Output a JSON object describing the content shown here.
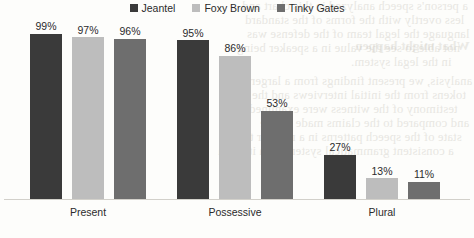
{
  "chart_data": {
    "type": "bar",
    "title": "",
    "subtitle": "",
    "xlabel": "",
    "ylabel": "",
    "ylim": [
      0,
      100
    ],
    "grid": false,
    "legend_position": "top-center",
    "value_suffix": "%",
    "categories": [
      "Present",
      "Possessive",
      "Plural"
    ],
    "series": [
      {
        "name": "Jeantel",
        "color": "#3a3a3a",
        "values": [
          99,
          97,
          96
        ],
        "labels": [
          "99%",
          "97%",
          "96%"
        ]
      },
      {
        "name": "Foxy Brown",
        "color": "#bdbdbd",
        "values": [
          95,
          86,
          53
        ],
        "labels": [
          "95%",
          "86%",
          "53%"
        ]
      },
      {
        "name": "Tinky Gates",
        "color": "#6e6e6e",
        "values": [
          27,
          13,
          11
        ],
        "labels": [
          "27%",
          "13%",
          "11%"
        ]
      }
    ],
    "groups": [
      {
        "category": "Present",
        "bars": [
          {
            "series": "Jeantel",
            "value": 99,
            "label": "99%",
            "color": "#3a3a3a"
          },
          {
            "series": "Foxy Brown",
            "value": 97,
            "label": "97%",
            "color": "#bdbdbd"
          },
          {
            "series": "Tinky Gates",
            "value": 96,
            "label": "96%",
            "color": "#6e6e6e"
          }
        ]
      },
      {
        "category": "Possessive",
        "bars": [
          {
            "series": "Jeantel",
            "value": 95,
            "label": "95%",
            "color": "#3a3a3a"
          },
          {
            "series": "Foxy Brown",
            "value": 86,
            "label": "86%",
            "color": "#bdbdbd"
          },
          {
            "series": "Tinky Gates",
            "value": 53,
            "label": "53%",
            "color": "#6e6e6e"
          }
        ]
      },
      {
        "category": "Plural",
        "bars": [
          {
            "series": "Jeantel",
            "value": 27,
            "label": "27%",
            "color": "#3a3a3a"
          },
          {
            "series": "Foxy Brown",
            "value": 13,
            "label": "13%",
            "color": "#bdbdbd"
          },
          {
            "series": "Tinky Gates",
            "value": 11,
            "label": "11%",
            "color": "#6e6e6e"
          }
        ]
      }
    ]
  },
  "legend": {
    "items": [
      {
        "label": "Jeantel",
        "color": "#3a3a3a"
      },
      {
        "label": "Foxy Brown",
        "color": "#bdbdbd"
      },
      {
        "label": "Tinky Gates",
        "color": "#6e6e6e"
      }
    ]
  },
  "page": {
    "background_color": "#fdfdfb",
    "ghost_text_color": "#c9c6bd",
    "ghost_lines": [
      "a person's speech analyzed in this chart and",
      "less overtly with the forms of the standard",
      "language the legal team of the defense was",
      "not able to see the value in a speaker being",
      "in the legal system.",
      "analysis, we present findings from a larger",
      "tokens from the initial interviews and the",
      "testimony of the witness were examined",
      "and compared to the claims made by the",
      "state of the speech patterns in a manner that",
      "a consistent grammatical system with its own",
      "What might happen"
    ]
  }
}
